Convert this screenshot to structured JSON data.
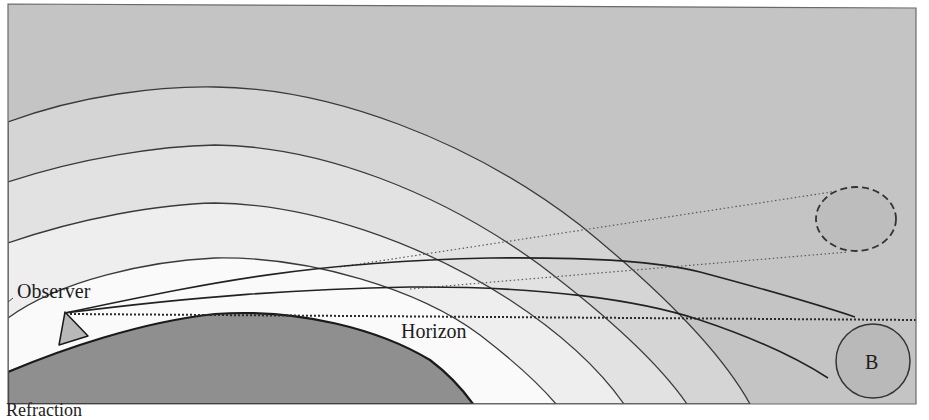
{
  "figure": {
    "type": "atmospheric-refraction-diagram",
    "labels": {
      "observer": "Observer",
      "horizon": "Horizon",
      "object": "B"
    },
    "caption_partial": "Refraction",
    "colors": {
      "sky": "#c4c4c4",
      "atmosphere_layer_1": "#d6d6d6",
      "atmosphere_layer_2": "#e4e4e4",
      "atmosphere_layer_3": "#efefef",
      "atmosphere_layer_4": "#fafafa",
      "earth": "#8f8f8f",
      "observer_mountain": "#b8b8b8",
      "object_fill": "#b9b9b9",
      "apparent_object_fill": "#bdbdbd",
      "line": "#2a2a2a"
    },
    "elements": {
      "atmosphere_layers": 4,
      "refracted_rays": 2,
      "apparent_lines": 2,
      "horizon_line": "dotted",
      "apparent_position": "dashed ellipse",
      "true_position": "solid circle labeled B"
    }
  }
}
